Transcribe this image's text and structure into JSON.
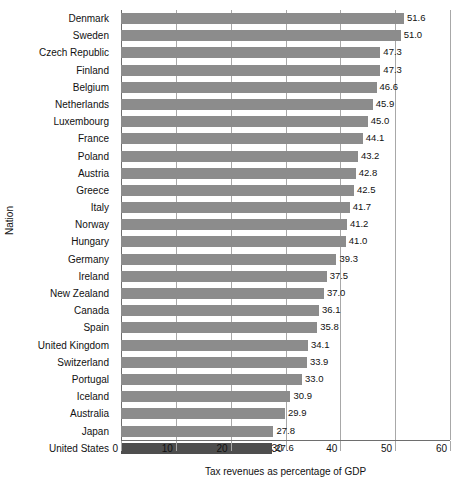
{
  "chart_data": {
    "type": "bar",
    "orientation": "horizontal",
    "title": "",
    "xlabel": "Tax revenues as percentage of GDP",
    "ylabel": "Nation",
    "xlim": [
      0,
      60
    ],
    "xticks": [
      0,
      10,
      20,
      30,
      40,
      50,
      60
    ],
    "xtick_labels": [
      "0",
      "10",
      "20",
      "30",
      "40",
      "50",
      "60"
    ],
    "grid": "vertical",
    "legend": "none",
    "bar_color": "#8c8c8c",
    "highlight_color": "#4e4e4e",
    "highlight_category": "United States",
    "categories": [
      "Denmark",
      "Sweden",
      "Czech Republic",
      "Finland",
      "Belgium",
      "Netherlands",
      "Luxembourg",
      "France",
      "Poland",
      "Austria",
      "Greece",
      "Italy",
      "Norway",
      "Hungary",
      "Germany",
      "Ireland",
      "New Zealand",
      "Canada",
      "Spain",
      "United Kingdom",
      "Switzerland",
      "Portugal",
      "Iceland",
      "Australia",
      "Japan",
      "United States"
    ],
    "values": [
      51.6,
      51.0,
      47.3,
      47.3,
      46.6,
      45.9,
      45.0,
      44.1,
      43.2,
      42.8,
      42.5,
      41.7,
      41.2,
      41.0,
      39.3,
      37.5,
      37.0,
      36.1,
      35.8,
      34.1,
      33.9,
      33.0,
      30.9,
      29.9,
      27.8,
      27.6
    ],
    "value_labels": [
      "51.6",
      "51.0",
      "47.3",
      "47.3",
      "46.6",
      "45.9",
      "45.0",
      "44.1",
      "43.2",
      "42.8",
      "42.5",
      "41.7",
      "41.2",
      "41.0",
      "39.3",
      "37.5",
      "37.0",
      "36.1",
      "35.8",
      "34.1",
      "33.9",
      "33.0",
      "30.9",
      "29.9",
      "27.8",
      "27.6"
    ]
  }
}
